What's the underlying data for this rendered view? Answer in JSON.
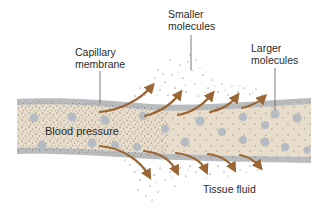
{
  "figure": {
    "type": "capillary filtration diagram",
    "labels": {
      "capillary_membrane_line1": "Capillary",
      "capillary_membrane_line2": "membrane",
      "smaller_molecules_line1": "Smaller",
      "smaller_molecules_line2": "molecules",
      "larger_molecules_line1": "Larger",
      "larger_molecules_line2": "molecules",
      "blood_pressure": "Blood pressure",
      "tissue_fluid": "Tissue fluid"
    },
    "colors": {
      "vessel_fill": "#e8dccb",
      "membrane": "#b9bcbe",
      "large_molecule": "#b4bbc2",
      "arrow": "#9b6633",
      "small_molecule_dot": "#4a4a4a",
      "text": "#2b2b2b",
      "leader_line": "#5a5a5a"
    },
    "arrows": {
      "upward_count": 5,
      "downward_count": 5
    }
  }
}
